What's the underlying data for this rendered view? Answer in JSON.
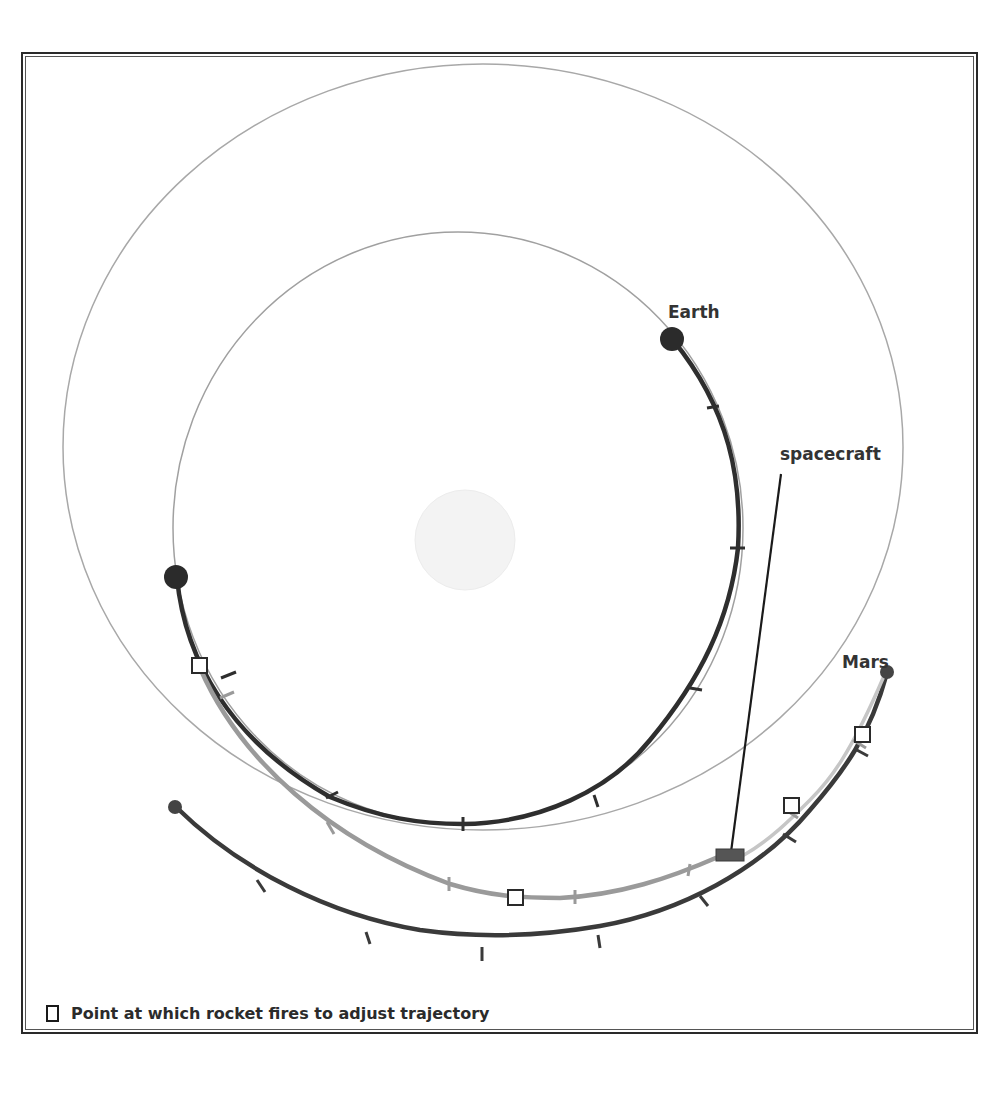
{
  "figure": {
    "labels": {
      "earth": "Earth",
      "mars": "Mars",
      "spacecraft": "spacecraft"
    },
    "legend": {
      "marker": "white-square",
      "text": "Point at which rocket fires to adjust trajectory"
    },
    "colors": {
      "orbit_line": "#a8a8a8",
      "earth_path": "#2e2e2e",
      "mars_path": "#3a3a3a",
      "transfer_path": "#9a9a9a",
      "transfer_path_late": "#c4c4c4",
      "sun": "#f2f2f2",
      "spacecraft": "#555555",
      "frame": "#2a2a2a"
    },
    "sun": {
      "cx": 465,
      "cy": 540,
      "r": 50
    },
    "earth_orbit": {
      "cx": 465,
      "cy": 528,
      "r": 295
    },
    "mars_orbit": {
      "cx": 480,
      "cy": 448,
      "r": 418
    },
    "earth_start": {
      "x": 177,
      "y": 576
    },
    "earth_end": {
      "x": 672,
      "y": 340
    },
    "mars_start": {
      "x": 175,
      "y": 807
    },
    "mars_end": {
      "x": 887,
      "y": 672
    },
    "rocket_fire_points": [
      {
        "x": 200,
        "y": 666
      },
      {
        "x": 516,
        "y": 898
      },
      {
        "x": 792,
        "y": 806
      },
      {
        "x": 862,
        "y": 734
      }
    ],
    "spacecraft_marker": {
      "x": 716,
      "y": 850,
      "w": 28,
      "h": 12
    },
    "spacecraft_leader": {
      "x1": 731,
      "y1": 851,
      "x2": 781,
      "y2": 474
    }
  }
}
